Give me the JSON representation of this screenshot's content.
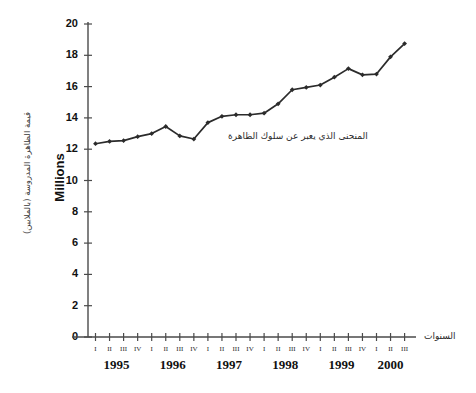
{
  "chart_data": {
    "type": "line",
    "title": "",
    "ylabel": "Millions",
    "ylabel_ar": "قيمة الظاهرة المدروسة (بالملايين)",
    "xlabel_ar": "السنوات",
    "annotation_ar": "المنحنى الذي يعبر عن سلوك الظاهرة",
    "ylim": [
      0,
      20
    ],
    "ytick_labels": [
      "20",
      "18",
      "16",
      "14",
      "12",
      "10",
      "8",
      "6",
      "4",
      "2",
      "0"
    ],
    "ytick_values": [
      20,
      18,
      16,
      14,
      12,
      10,
      8,
      6,
      4,
      2,
      0
    ],
    "grid": false,
    "legend": "none",
    "quarter_labels": [
      "I",
      "II",
      "III",
      "IV",
      "I",
      "II",
      "III",
      "IV",
      "I",
      "II",
      "III",
      "IV",
      "I",
      "II",
      "III",
      "IV",
      "I",
      "II",
      "III",
      "IV",
      "I",
      "II",
      "III"
    ],
    "year_labels": [
      "1995",
      "1996",
      "1997",
      "1998",
      "1999",
      "2000"
    ],
    "categories": [
      "1995 I",
      "1995 II",
      "1995 III",
      "1995 IV",
      "1996 I",
      "1996 II",
      "1996 III",
      "1996 IV",
      "1997 I",
      "1997 II",
      "1997 III",
      "1997 IV",
      "1998 I",
      "1998 II",
      "1998 III",
      "1998 IV",
      "1999 I",
      "1999 II",
      "1999 III",
      "1999 IV",
      "2000 I",
      "2000 II",
      "2000 III"
    ],
    "values": [
      12.35,
      12.5,
      12.55,
      12.8,
      13.0,
      13.45,
      12.85,
      12.65,
      13.7,
      14.1,
      14.2,
      14.2,
      14.3,
      14.9,
      15.8,
      15.95,
      16.1,
      16.6,
      17.15,
      16.75,
      16.8,
      17.9,
      18.75
    ],
    "marker": "diamond",
    "line_color": "#2b2b2b"
  }
}
